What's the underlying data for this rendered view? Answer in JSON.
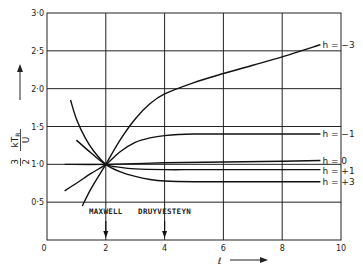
{
  "chart_data": {
    "type": "line",
    "title": "",
    "xlabel": "ℓ",
    "ylabel": "3/2 · kT_R / U",
    "ylabel_parts": {
      "prefix_num": "3",
      "prefix_den": "2",
      "num": "kT",
      "num_sub": "R",
      "den": "U"
    },
    "xlim": [
      0,
      10
    ],
    "ylim": [
      0,
      3.0
    ],
    "x_ticks": [
      "0",
      "2",
      "4",
      "6",
      "8",
      "10"
    ],
    "x_tick_values": [
      0,
      2,
      4,
      6,
      8,
      10
    ],
    "y_ticks": [
      "0·5",
      "1·0",
      "1·5",
      "2·0",
      "2·5",
      "3·0"
    ],
    "y_tick_values": [
      0.5,
      1.0,
      1.5,
      2.0,
      2.5,
      3.0
    ],
    "grid": true,
    "annotations": [
      {
        "text": "MAXWELL",
        "x": 2
      },
      {
        "text": "DRUYVESTEYN",
        "x": 4
      }
    ],
    "series": [
      {
        "name": "h = −3",
        "x": [
          1.2,
          1.5,
          2.0,
          2.5,
          3.0,
          3.5,
          4.0,
          5.0,
          6.0,
          7.0,
          8.0,
          9.3
        ],
        "y": [
          0.45,
          0.68,
          1.0,
          1.33,
          1.6,
          1.8,
          1.93,
          2.08,
          2.2,
          2.31,
          2.42,
          2.58
        ]
      },
      {
        "name": "h = −1",
        "x": [
          0.6,
          1.0,
          1.5,
          2.0,
          2.5,
          3.0,
          3.5,
          4.0,
          5.0,
          6.0,
          8.0,
          9.3
        ],
        "y": [
          0.65,
          0.75,
          0.88,
          1.0,
          1.17,
          1.29,
          1.35,
          1.38,
          1.4,
          1.4,
          1.4,
          1.4
        ]
      },
      {
        "name": "h = 0",
        "x": [
          0.6,
          2.0,
          4.0,
          6.0,
          8.0,
          9.3
        ],
        "y": [
          1.0,
          1.0,
          1.02,
          1.03,
          1.04,
          1.05
        ]
      },
      {
        "name": "h = +1",
        "x": [
          1.0,
          1.5,
          2.0,
          2.5,
          3.0,
          4.0,
          5.0,
          6.0,
          8.0,
          9.3
        ],
        "y": [
          1.32,
          1.15,
          1.0,
          0.96,
          0.94,
          0.93,
          0.93,
          0.93,
          0.93,
          0.93
        ]
      },
      {
        "name": "h = +3",
        "x": [
          0.8,
          1.0,
          1.3,
          1.6,
          2.0,
          2.5,
          3.0,
          3.5,
          4.0,
          5.0,
          6.0,
          8.0,
          9.3
        ],
        "y": [
          1.85,
          1.6,
          1.35,
          1.17,
          1.0,
          0.9,
          0.84,
          0.8,
          0.78,
          0.77,
          0.77,
          0.77,
          0.77
        ]
      }
    ]
  }
}
